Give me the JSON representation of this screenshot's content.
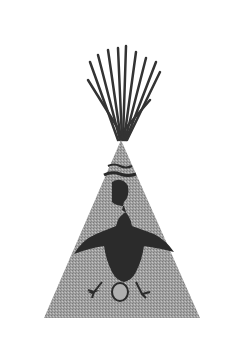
{
  "image": {
    "subject": "tipi with painted thunderbird figure",
    "colors": {
      "background": "#ffffff",
      "tipi": "#9a9a9a",
      "figure": "#2a2a2a",
      "poles": "#3a3a3a"
    }
  }
}
